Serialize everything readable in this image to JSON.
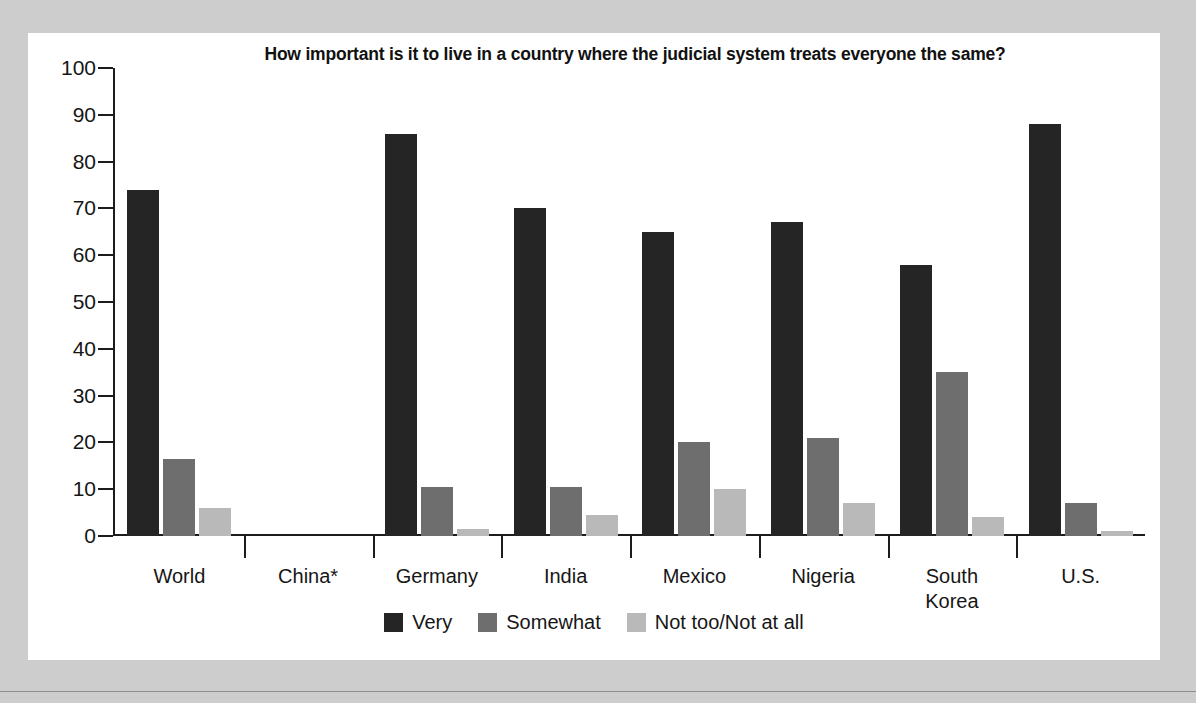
{
  "chart_data": {
    "type": "bar",
    "title": "How important is it to live in a country where the judicial system treats everyone the same?",
    "xlabel": "",
    "ylabel": "",
    "ylim": [
      0,
      100
    ],
    "ytick_step": 10,
    "yticks": [
      100,
      90,
      80,
      70,
      60,
      50,
      40,
      30,
      20,
      10,
      0
    ],
    "grid": false,
    "legend_position": "bottom-center",
    "categories": [
      "World",
      "China*",
      "Germany",
      "India",
      "Mexico",
      "Nigeria",
      "South Korea",
      "U.S."
    ],
    "category_lines": [
      [
        "World"
      ],
      [
        "China*"
      ],
      [
        "Germany"
      ],
      [
        "India"
      ],
      [
        "Mexico"
      ],
      [
        "Nigeria"
      ],
      [
        "South",
        "Korea"
      ],
      [
        "U.S."
      ]
    ],
    "series": [
      {
        "name": "Very",
        "color": "#252525",
        "values": [
          74,
          null,
          86,
          70,
          65,
          67,
          58,
          88
        ]
      },
      {
        "name": "Somewhat",
        "color": "#6e6e6e",
        "values": [
          16.5,
          null,
          10.5,
          10.5,
          20,
          21,
          35,
          7
        ]
      },
      {
        "name": "Not too/Not at all",
        "color": "#b9b9b9",
        "values": [
          6,
          null,
          1.5,
          4.5,
          10,
          7,
          4,
          1
        ]
      }
    ]
  },
  "legend": {
    "items": [
      {
        "label": "Very",
        "swatch": "very"
      },
      {
        "label": "Somewhat",
        "swatch": "somewhat"
      },
      {
        "label": "Not too/Not at all",
        "swatch": "nottoo"
      }
    ]
  },
  "colors": {
    "page_background": "#cdcdcd",
    "panel_background": "#ffffff",
    "axis": "#1c1c1c",
    "text": "#161616",
    "series_very": "#252525",
    "series_somewhat": "#6e6e6e",
    "series_not_too": "#b9b9b9"
  }
}
